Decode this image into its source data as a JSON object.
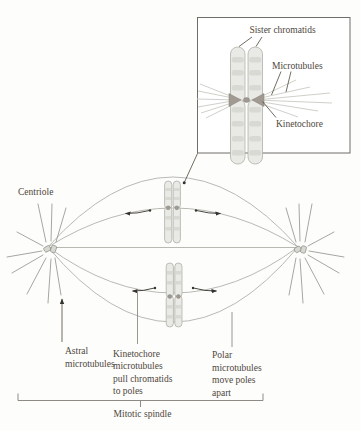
{
  "colors": {
    "background": "#fdfdfc",
    "ink": "#4e473b",
    "fiber": "#b9b9b4",
    "ray": "#9c9c96",
    "pointer": "#8d8b83",
    "arrow": "#35332e",
    "chromatid_fill": "#e9e9e5",
    "chromatid_stroke": "#b0b0aa",
    "band": "#cfcfc8",
    "kinetochore": "#a09a92",
    "inset_border": "#6f6d68",
    "inset_fan": "#d0d0ca"
  },
  "inset": {
    "labels": {
      "sister_chromatids": "Sister chromatids",
      "microtubules": "Microtubules",
      "kinetochore": "Kinetochore"
    }
  },
  "main": {
    "centriole": "Centriole",
    "astral_label": [
      "Astral",
      "microtubules"
    ],
    "kinetochore_label": [
      "Kinetochore",
      "microtubules",
      "pull chromatids",
      "to poles"
    ],
    "polar_label": [
      "Polar",
      "microtubules",
      "move poles",
      "apart"
    ],
    "bracket_label": "Mitotic spindle"
  }
}
